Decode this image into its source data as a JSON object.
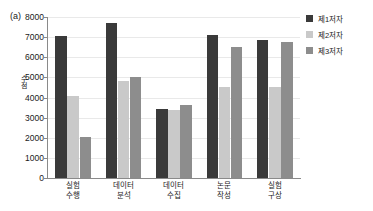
{
  "panel": {
    "label": "(a)"
  },
  "chart_data": {
    "type": "bar",
    "title": "",
    "subtitle": "",
    "xlabel": "",
    "ylabel": "수점",
    "ylim": [
      0,
      8000
    ],
    "ytick_values": [
      0,
      1000,
      2000,
      3000,
      4000,
      5000,
      6000,
      7000,
      8000
    ],
    "ytick_labels": [
      "0",
      "1000",
      "2000",
      "3000",
      "4000",
      "5000",
      "6000",
      "7000",
      "8000"
    ],
    "grid": true,
    "legend_position": "right",
    "categories": [
      "실험 수행",
      "데이터 분석",
      "데이터 수집",
      "논문 작성",
      "실험 구상"
    ],
    "category_lines": [
      [
        "실험",
        "수행"
      ],
      [
        "데이터",
        "분석"
      ],
      [
        "데이터",
        "수집"
      ],
      [
        "논문",
        "작성"
      ],
      [
        "실험",
        "구상"
      ]
    ],
    "series": [
      {
        "name": "제1저자",
        "color": "#3a3a3a",
        "values": [
          7050,
          7700,
          3430,
          7100,
          6880
        ]
      },
      {
        "name": "제2저자",
        "color": "#c9c9c9",
        "values": [
          4100,
          4800,
          3390,
          4530,
          4500
        ]
      },
      {
        "name": "제3저자",
        "color": "#8d8d8d",
        "values": [
          2050,
          5000,
          3650,
          6500,
          6760
        ]
      }
    ]
  }
}
